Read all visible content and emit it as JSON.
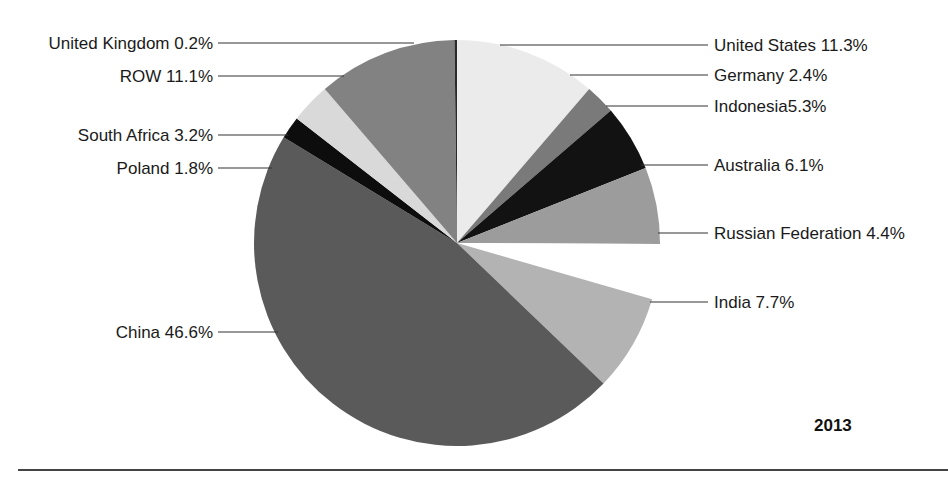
{
  "chart_data": {
    "type": "pie",
    "title": "",
    "annotation": "2013",
    "start_angle_deg": 0,
    "direction": "clockwise",
    "categories": [
      "United States",
      "Germany",
      "Indonesia",
      "Australia",
      "Russian Federation",
      "India",
      "China",
      "Poland",
      "South Africa",
      "ROW",
      "United Kingdom"
    ],
    "values": [
      11.3,
      2.4,
      5.3,
      6.1,
      4.4,
      7.7,
      46.6,
      1.8,
      3.2,
      11.1,
      0.2
    ],
    "unit": "%",
    "colors": [
      "#ebebeb",
      "#7a7a7a",
      "#121212",
      "#9c9c9c",
      "#ffffff",
      "#b3b3b3",
      "#5a5a5a",
      "#0d0d0d",
      "#d9d9d9",
      "#828282",
      "#2a2a2a"
    ],
    "labels": [
      {
        "text": "United States 11.3%",
        "side": "right",
        "y": 45
      },
      {
        "text": "Germany 2.4%",
        "side": "right",
        "y": 75
      },
      {
        "text": "Indonesia5.3%",
        "side": "right",
        "y": 106
      },
      {
        "text": "Australia 6.1%",
        "side": "right",
        "y": 165
      },
      {
        "text": "Russian Federation 4.4%",
        "side": "right",
        "y": 233
      },
      {
        "text": "India 7.7%",
        "side": "right",
        "y": 302
      },
      {
        "text": "China 46.6%",
        "side": "left",
        "y": 332
      },
      {
        "text": "Poland 1.8%",
        "side": "left",
        "y": 168
      },
      {
        "text": "South Africa 3.2%",
        "side": "left",
        "y": 135
      },
      {
        "text": "ROW 11.1%",
        "side": "left",
        "y": 76
      },
      {
        "text": "United Kingdom 0.2%",
        "side": "left",
        "y": 43
      }
    ],
    "legend": "none",
    "grid": false
  }
}
